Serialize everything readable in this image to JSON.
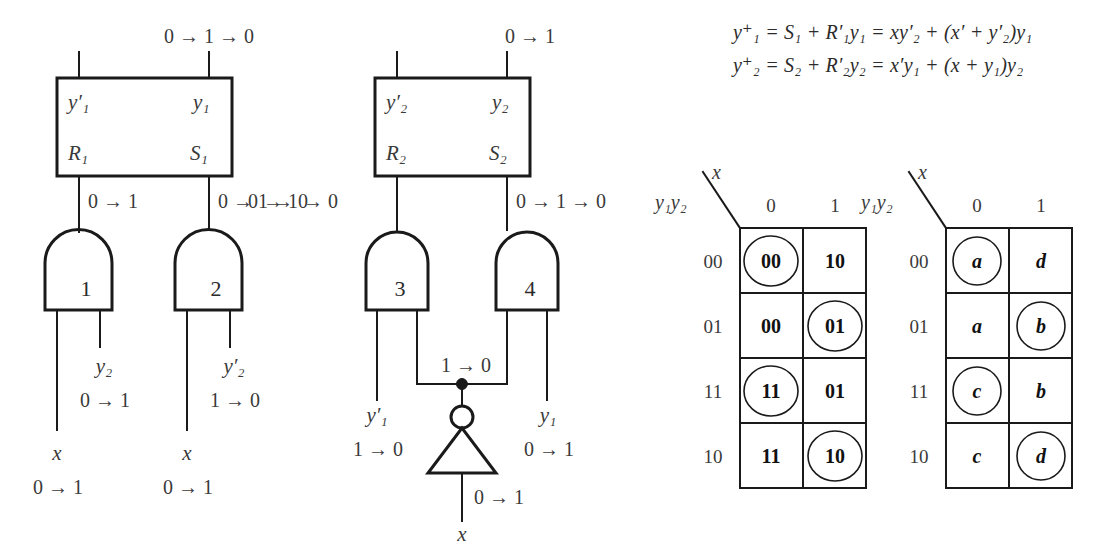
{
  "figure": {
    "background": "#ffffff",
    "ink": "#1a1a1a"
  },
  "equations": [
    {
      "id": "eq1",
      "text": "y⁺₁ = S₁ + R′₁y₁ = xy′₂ + (x′ + y′₂)y₁",
      "parts": {
        "lhs": "y",
        "lhs_sup": "+",
        "lhs_sub": "1",
        "rhs1": "S",
        "rhs1_sub": "1",
        "rhs2": "R",
        "rhs2_sub": "1",
        "rhs3": "y",
        "rhs3_sub": "1",
        "expr": "xy′₂ + (x′ + y′₂)y₁"
      }
    },
    {
      "id": "eq2",
      "text": "y⁺₂ = S₂ + R′₂y₂ = x′y₁ + (x + y₁)y₂",
      "parts": {
        "lhs": "y",
        "lhs_sup": "+",
        "lhs_sub": "2",
        "rhs1": "S",
        "rhs1_sub": "2",
        "rhs2": "R",
        "rhs2_sub": "2",
        "rhs3": "y",
        "rhs3_sub": "2",
        "expr": "x′y₁ + (x + y₁)y₂"
      }
    }
  ],
  "latch1": {
    "name": "latch-1",
    "top_wire_label": "0 → 1 → 0",
    "ports": {
      "top_left": "y′₁",
      "top_right": "y₁",
      "bottom_left": "R₁",
      "bottom_right": "S₁"
    },
    "out_left_label": "0 → 1",
    "out_right_label": "0 → 1 → 0"
  },
  "latch2": {
    "name": "latch-2",
    "top_wire_label": "0 → 1",
    "ports": {
      "top_left": "y′₂",
      "top_right": "y₂",
      "bottom_left": "R₂",
      "bottom_right": "S₂"
    },
    "out_left_label": "0 → 1 → 0",
    "out_right_label": "0 → 1 → 0"
  },
  "gates": [
    {
      "number": "1",
      "inputs": [
        {
          "label": "x",
          "transition": "0 → 1"
        },
        {
          "label": "y₂",
          "transition": "0 → 1"
        }
      ]
    },
    {
      "number": "2",
      "inputs": [
        {
          "label": "x",
          "transition": "0 → 1"
        },
        {
          "label": "y′₂",
          "transition": "1 → 0"
        }
      ]
    },
    {
      "number": "3",
      "inputs": [
        {
          "label": "y′₁",
          "transition": "1 → 0"
        },
        {
          "label": "",
          "transition": ""
        }
      ]
    },
    {
      "number": "4",
      "inputs": [
        {
          "label": "y₁",
          "transition": "0 → 1"
        },
        {
          "label": "",
          "transition": ""
        }
      ]
    }
  ],
  "inverter": {
    "name": "inverter",
    "output_node_label": "1 → 0",
    "input_label": "x",
    "input_transition": "0 → 1"
  },
  "map_transition": {
    "name": "transition-map",
    "corner_row_label": "y₁y₂",
    "corner_col_label": "x",
    "col_headers": [
      "0",
      "1"
    ],
    "row_headers": [
      "00",
      "01",
      "11",
      "10"
    ],
    "cells": [
      [
        {
          "value": "00",
          "circled": true
        },
        {
          "value": "10",
          "circled": false
        }
      ],
      [
        {
          "value": "00",
          "circled": false
        },
        {
          "value": "01",
          "circled": true
        }
      ],
      [
        {
          "value": "11",
          "circled": true
        },
        {
          "value": "01",
          "circled": false
        }
      ],
      [
        {
          "value": "11",
          "circled": false
        },
        {
          "value": "10",
          "circled": true
        }
      ]
    ]
  },
  "map_state": {
    "name": "state-map",
    "corner_row_label": "y₁y₂",
    "corner_col_label": "x",
    "col_headers": [
      "0",
      "1"
    ],
    "row_headers": [
      "00",
      "01",
      "11",
      "10"
    ],
    "cells": [
      [
        {
          "value": "a",
          "circled": true
        },
        {
          "value": "d",
          "circled": false
        }
      ],
      [
        {
          "value": "a",
          "circled": false
        },
        {
          "value": "b",
          "circled": true
        }
      ],
      [
        {
          "value": "c",
          "circled": true
        },
        {
          "value": "b",
          "circled": false
        }
      ],
      [
        {
          "value": "c",
          "circled": false
        },
        {
          "value": "d",
          "circled": true
        }
      ]
    ]
  }
}
